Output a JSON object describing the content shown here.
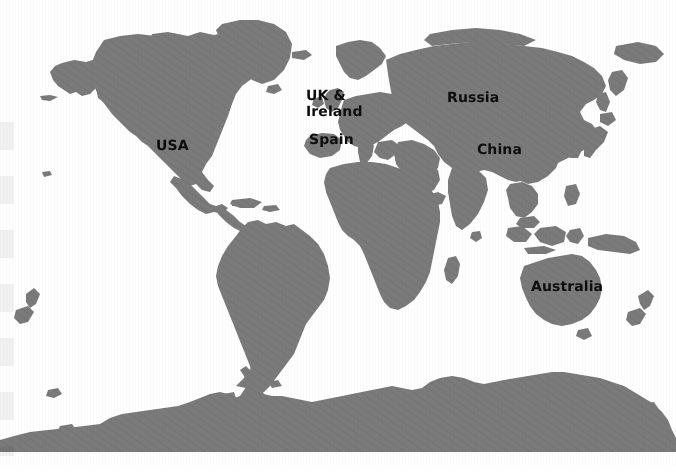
{
  "map": {
    "title": "World Map",
    "projection": "equirectangular",
    "land_color": "#7b7b7b",
    "ocean_color": "#ffffff",
    "label_color": "#0d0d0d",
    "width": 676,
    "height": 472,
    "labels": [
      {
        "id": "usa",
        "text": "USA",
        "x": 156,
        "y": 139,
        "size": 14
      },
      {
        "id": "uk-ireland",
        "text": "UK &\nIreland",
        "x": 306,
        "y": 88,
        "size": 14
      },
      {
        "id": "spain",
        "text": "Spain",
        "x": 309,
        "y": 133,
        "size": 14
      },
      {
        "id": "russia",
        "text": "Russia",
        "x": 447,
        "y": 91,
        "size": 14
      },
      {
        "id": "china",
        "text": "China",
        "x": 477,
        "y": 143,
        "size": 14
      },
      {
        "id": "australia",
        "text": "Australia",
        "x": 531,
        "y": 280,
        "size": 14
      }
    ],
    "continents": [
      "North America",
      "South America",
      "Europe",
      "Africa",
      "Asia",
      "Australia",
      "Antarctica"
    ]
  }
}
